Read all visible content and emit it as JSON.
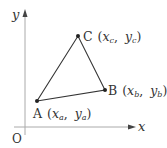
{
  "diagram": {
    "axes": {
      "x_label": "x",
      "y_label": "y",
      "origin_label": "O"
    },
    "points": [
      {
        "name": "A",
        "coord_label": "(x_a, y_a)",
        "x_sym": "x",
        "x_sub": "a",
        "y_sym": "y",
        "y_sub": "a"
      },
      {
        "name": "B",
        "coord_label": "(x_b, y_b)",
        "x_sym": "x",
        "x_sub": "b",
        "y_sym": "y",
        "y_sub": "b"
      },
      {
        "name": "C",
        "coord_label": "(x_c, y_c)",
        "x_sym": "x",
        "x_sub": "c",
        "y_sym": "y",
        "y_sub": "c"
      }
    ],
    "shape": "triangle ABC",
    "line_color": "#333333",
    "axis_color": "#999999"
  }
}
